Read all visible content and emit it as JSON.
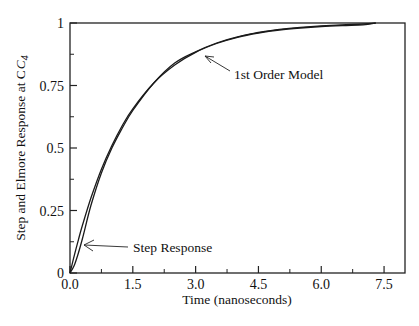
{
  "chart_data": {
    "type": "line",
    "title": "",
    "xlabel": "Time (nanoseconds)",
    "ylabel": "Step and Elmore Response at C",
    "ylabel_subscript": "4",
    "xlim": [
      0,
      8
    ],
    "ylim": [
      0,
      1
    ],
    "x_ticks": [
      0.0,
      1.5,
      3.0,
      4.5,
      6.0,
      7.5
    ],
    "x_tick_labels": [
      "0.0",
      "1.5",
      "3.0",
      "4.5",
      "6.0",
      "7.5"
    ],
    "x_minor_ticks": [
      0.75,
      2.25,
      3.75,
      5.25,
      6.75
    ],
    "y_ticks": [
      0,
      0.25,
      0.5,
      0.75,
      1
    ],
    "y_tick_labels": [
      "0",
      "0.25",
      "0.5",
      "0.75",
      "1"
    ],
    "y_minor_ticks": [
      0.125,
      0.375,
      0.625,
      0.875
    ],
    "grid": false,
    "legend": null,
    "series": [
      {
        "name": "Step Response",
        "x": [
          0,
          0.1,
          0.2,
          0.3,
          0.5,
          0.75,
          1.0,
          1.25,
          1.5,
          2.0,
          2.5,
          3.0,
          3.5,
          4.0,
          4.5,
          5.0,
          5.5,
          6.0,
          6.5,
          7.0,
          7.3
        ],
        "y": [
          0,
          0.03,
          0.08,
          0.14,
          0.27,
          0.4,
          0.5,
          0.58,
          0.65,
          0.76,
          0.84,
          0.885,
          0.92,
          0.945,
          0.962,
          0.975,
          0.983,
          0.989,
          0.993,
          0.996,
          1.0
        ]
      },
      {
        "name": "1st Order Model",
        "x": [
          0,
          0.1,
          0.2,
          0.3,
          0.5,
          0.75,
          1.0,
          1.25,
          1.5,
          2.0,
          2.5,
          3.0,
          3.5,
          4.0,
          4.5,
          5.0,
          5.5,
          6.0,
          6.5,
          7.0,
          7.3
        ],
        "y": [
          0,
          0.069,
          0.133,
          0.193,
          0.3,
          0.415,
          0.51,
          0.59,
          0.657,
          0.76,
          0.832,
          0.883,
          0.918,
          0.943,
          0.96,
          0.972,
          0.98,
          0.986,
          0.99,
          0.993,
          1.0
        ]
      }
    ],
    "annotations": [
      {
        "text": "1st Order Model",
        "arrow_to": [
          3.2,
          0.87
        ],
        "text_at": [
          3.9,
          0.79
        ]
      },
      {
        "text": "Step Response",
        "arrow_to": [
          0.3,
          0.115
        ],
        "text_at": [
          1.55,
          0.105
        ]
      }
    ]
  }
}
